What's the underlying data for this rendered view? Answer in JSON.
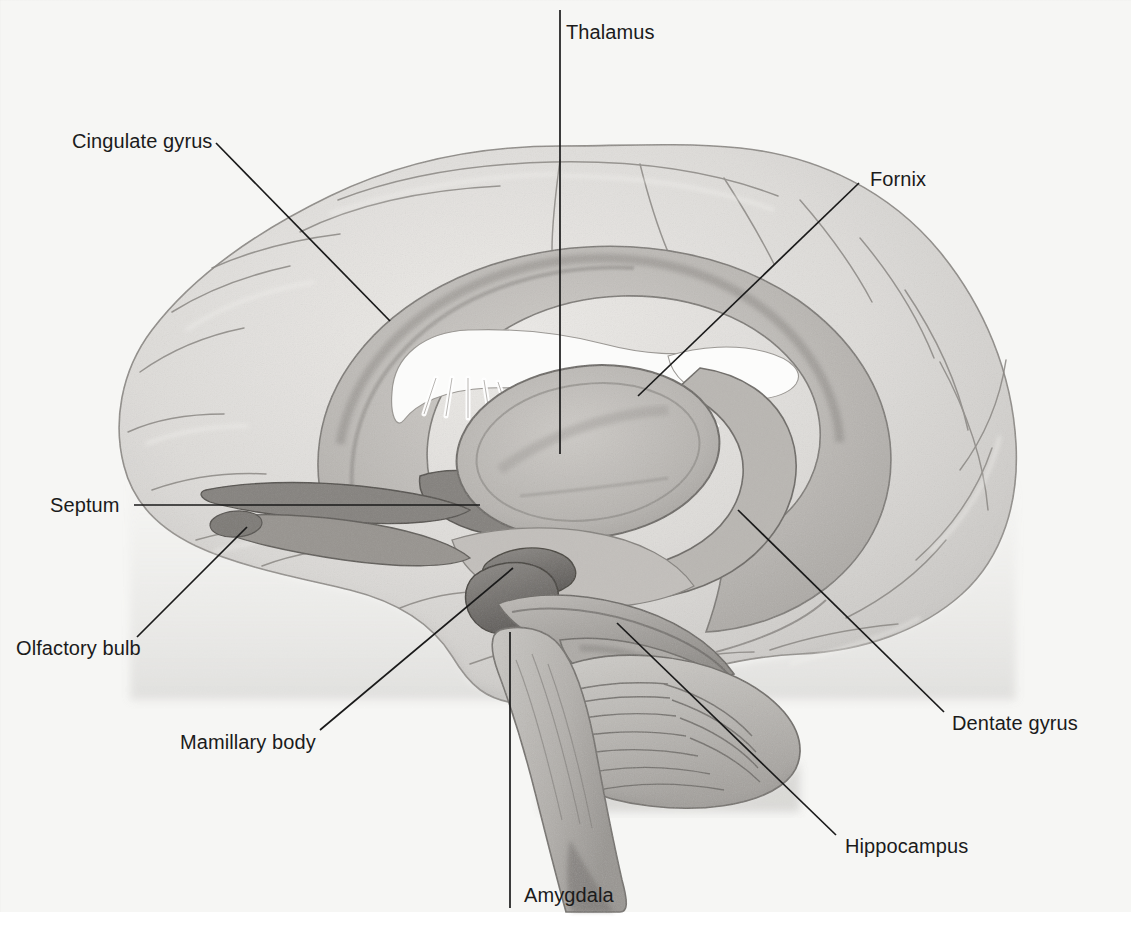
{
  "figure": {
    "style": "graphite pencil anatomical illustration",
    "background_color": "#f6f6f4",
    "line_color": "#1a1a1a",
    "width": 1131,
    "height": 948
  },
  "labels": [
    {
      "id": "thalamus",
      "text": "Thalamus",
      "x": 566,
      "y": 22,
      "leader": "M 560 10 L 560 454",
      "anchor": "start"
    },
    {
      "id": "cingulate-gyrus",
      "text": "Cingulate gyrus",
      "x": 72,
      "y": 131,
      "leader": "M 216 143 L 390 321",
      "anchor": "start"
    },
    {
      "id": "fornix",
      "text": "Fornix",
      "x": 870,
      "y": 169,
      "leader": "M 859 183 L 638 396",
      "anchor": "start"
    },
    {
      "id": "septum",
      "text": "Septum",
      "x": 50,
      "y": 495,
      "leader": "M 134 505 L 480 505",
      "anchor": "start"
    },
    {
      "id": "olfactory-bulb",
      "text": "Olfactory bulb",
      "x": 16,
      "y": 638,
      "leader": "M 137 637 L 247 527",
      "anchor": "start"
    },
    {
      "id": "mamillary-body",
      "text": "Mamillary body",
      "x": 180,
      "y": 732,
      "leader": "M 320 730 L 513 568",
      "anchor": "start"
    },
    {
      "id": "amygdala",
      "text": "Amygdala",
      "x": 524,
      "y": 885,
      "leader": "M 510 632 L 510 908",
      "anchor": "start"
    },
    {
      "id": "hippocampus",
      "text": "Hippocampus",
      "x": 845,
      "y": 836,
      "leader": "M 617 623 L 836 835",
      "anchor": "start"
    },
    {
      "id": "dentate-gyrus",
      "text": "Dentate gyrus",
      "x": 952,
      "y": 713,
      "leader": "M 738 510 L 944 712",
      "anchor": "start"
    }
  ]
}
